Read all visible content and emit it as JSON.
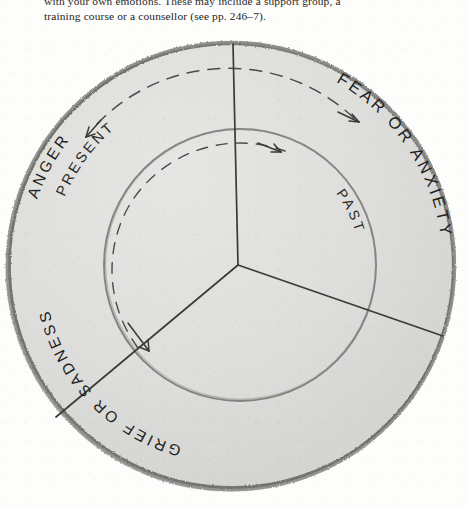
{
  "page": {
    "width": 467,
    "height": 508,
    "background_color": "#fdfdfc",
    "ink_color": "#2b2b29",
    "pencil_rim_color": "#6f6f6d",
    "sector_fill_color": "#dcdcda"
  },
  "body_text": {
    "line_1": "with your own emotions. These may include a support group, a",
    "line_2": "training course or a counsellor (see pp. 246–7)."
  },
  "diagram": {
    "name": "emotions-circle-diagram",
    "outer_circle": {
      "center_x": 231,
      "center_y": 266,
      "radius": 224
    },
    "inner_circle": {
      "center_x": 240,
      "center_y": 265,
      "radius": 136
    },
    "sector_labels": [
      {
        "id": "fear-or-anxiety",
        "text": "FEAR OR ANXIETY",
        "position": "top-right"
      },
      {
        "id": "anger",
        "text": "ANGER",
        "position": "top-left"
      },
      {
        "id": "grief-or-sadness",
        "text": "GRIEF OR SADNESS",
        "position": "bottom-left"
      }
    ],
    "ring_labels": [
      {
        "id": "present",
        "text": "PRESENT",
        "ring": "outer"
      },
      {
        "id": "past",
        "text": "PAST",
        "ring": "inner"
      }
    ],
    "arrows": [
      {
        "id": "present-arrow-left",
        "direction": "counter-clockwise"
      },
      {
        "id": "present-arrow-right",
        "direction": "clockwise"
      },
      {
        "id": "past-arrow-top",
        "direction": "clockwise"
      },
      {
        "id": "past-arrow-bottom",
        "direction": "counter-clockwise"
      }
    ],
    "divider_lines": 3
  }
}
